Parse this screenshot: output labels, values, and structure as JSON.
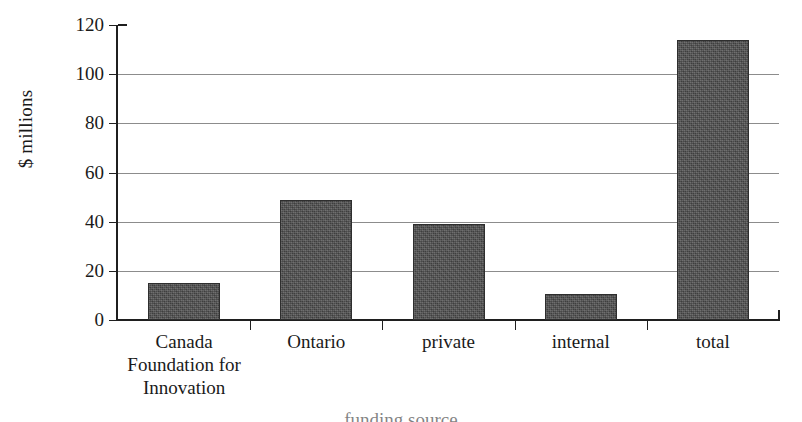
{
  "chart_data": {
    "type": "bar",
    "title": "",
    "xlabel": "funding source",
    "ylabel": "$ millions",
    "categories": [
      "Canada Foundation for Innovation",
      "Ontario",
      "private",
      "internal",
      "total"
    ],
    "category_lines": [
      [
        "Canada",
        "Foundation for",
        "Innovation"
      ],
      [
        "Ontario"
      ],
      [
        "private"
      ],
      [
        "internal"
      ],
      [
        "total"
      ]
    ],
    "values": [
      15,
      49,
      39,
      10.5,
      114
    ],
    "ylim": [
      0,
      120
    ],
    "yticks": [
      0,
      20,
      40,
      60,
      80,
      100,
      120
    ],
    "ytick_labels": [
      "0",
      "20",
      "40",
      "60",
      "80",
      "100",
      "120"
    ],
    "grid": true,
    "grid_axis": "y",
    "legend": "none",
    "bar_color": "#4d4d4d",
    "axis_color": "#1f1f1f",
    "gridline_color": "#8c8c8c",
    "background": "#ffffff"
  },
  "axis": {
    "y_title": "$ millions"
  }
}
